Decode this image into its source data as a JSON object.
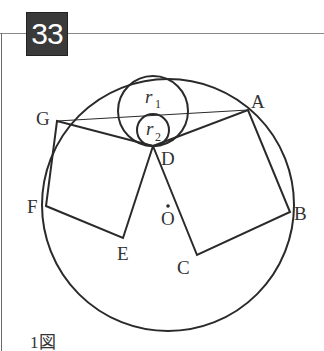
{
  "problem": {
    "number": "33",
    "figure_caption": "1図"
  },
  "colors": {
    "stroke": "#2a2a2a",
    "number_box_bg": "#3a3a3a",
    "number_text": "#ffffff",
    "frame_line": "#8a8a8a"
  },
  "diagram": {
    "big_circle": {
      "center_label": "O",
      "cx": 168,
      "cy": 205,
      "r": 126
    },
    "inner_circles": [
      {
        "label": "r",
        "subscript": "1",
        "cx": 153,
        "cy": 111,
        "r": 35
      },
      {
        "label": "r",
        "subscript": "2",
        "cx": 153,
        "cy": 130,
        "r": 16
      }
    ],
    "points": {
      "A": {
        "label": "A",
        "x": 248,
        "y": 110
      },
      "B": {
        "label": "B",
        "x": 290,
        "y": 212
      },
      "C": {
        "label": "C",
        "x": 197,
        "y": 255
      },
      "D": {
        "label": "D",
        "x": 153,
        "y": 146
      },
      "E": {
        "label": "E",
        "x": 123,
        "y": 238
      },
      "F": {
        "label": "F",
        "x": 46,
        "y": 206
      },
      "G": {
        "label": "G",
        "x": 57,
        "y": 121
      },
      "O": {
        "label": "O",
        "x": 168,
        "y": 207
      }
    },
    "segments": [
      "G-A",
      "G-D",
      "D-A",
      "A-B",
      "B-C",
      "C-D",
      "D-E",
      "E-F",
      "F-G"
    ],
    "squares": [
      "ABCD",
      "DEFG"
    ]
  }
}
